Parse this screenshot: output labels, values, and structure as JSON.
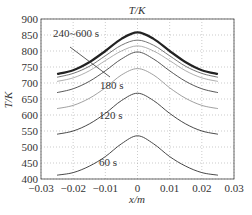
{
  "chart_data": {
    "type": "line",
    "title": "T/K",
    "xlabel": "x/m",
    "ylabel": "T/K",
    "xlim": [
      -0.03,
      0.03
    ],
    "ylim": [
      400,
      900
    ],
    "xticks": [
      -0.03,
      -0.02,
      -0.01,
      0,
      0.01,
      0.02,
      0.03
    ],
    "xtick_labels": [
      "−0.03",
      "−0.02",
      "−0.01",
      "0",
      "0.01",
      "0.02",
      "0.03"
    ],
    "yticks": [
      400,
      450,
      500,
      550,
      600,
      650,
      700,
      750,
      800,
      850,
      900
    ],
    "ytick_labels": [
      "400",
      "450",
      "500",
      "550",
      "600",
      "650",
      "700",
      "750",
      "800",
      "850",
      "900"
    ],
    "grid": true,
    "x": [
      -0.025,
      -0.02,
      -0.015,
      -0.01,
      -0.005,
      0,
      0.005,
      0.01,
      0.015,
      0.02,
      0.025
    ],
    "series": [
      {
        "name": "60 s",
        "values": [
          412,
          420,
          440,
          470,
          510,
          535,
          510,
          470,
          440,
          420,
          412
        ]
      },
      {
        "name": "120 s",
        "values": [
          540,
          550,
          572,
          605,
          645,
          668,
          645,
          605,
          572,
          550,
          540
        ]
      },
      {
        "name": "150 s",
        "values": [
          620,
          630,
          652,
          685,
          725,
          745,
          725,
          685,
          652,
          630,
          620
        ]
      },
      {
        "name": "180 s",
        "values": [
          670,
          682,
          705,
          738,
          775,
          797,
          775,
          738,
          705,
          682,
          670
        ]
      },
      {
        "name": "210 s",
        "values": [
          705,
          716,
          738,
          770,
          800,
          816,
          800,
          770,
          738,
          716,
          705
        ]
      },
      {
        "name": "225 s",
        "values": [
          718,
          730,
          752,
          785,
          818,
          834,
          818,
          785,
          752,
          730,
          718
        ]
      },
      {
        "name": "240~600 s",
        "values": [
          728,
          740,
          765,
          800,
          838,
          858,
          838,
          800,
          765,
          740,
          728
        ]
      }
    ],
    "annotations": [
      {
        "text": "240~600 s",
        "x": -0.019,
        "y": 850
      },
      {
        "text": "180 s",
        "x": -0.008,
        "y": 698
      },
      {
        "text": "120 s",
        "x": -0.009,
        "y": 608
      },
      {
        "text": "60 s",
        "x": -0.009,
        "y": 455
      }
    ]
  },
  "labels": {
    "title": "T/K",
    "ylabel": "T/K",
    "xlabel": "x/m",
    "ann_240": "240~600 s",
    "ann_180": "180 s",
    "ann_120": "120 s",
    "ann_60": "60 s"
  }
}
